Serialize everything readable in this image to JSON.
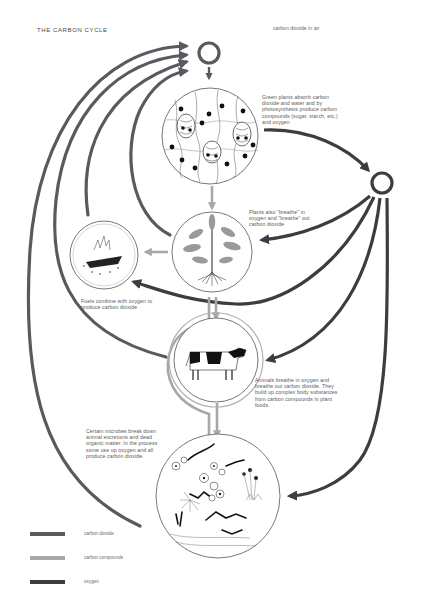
{
  "title": "THE CARBON CYCLE",
  "air_label": "carbon dioxide in air",
  "colors": {
    "carbon_dioxide": "#5c5860",
    "carbon_compounds": "#a8a8a8",
    "oxygen": "#3e3c40",
    "outline": "#555555",
    "text": "#5a5a5a"
  },
  "nodes": {
    "co2_circle": {
      "label": "carbon dioxide in air",
      "cx": 209,
      "cy": 53
    },
    "o2_circle": {
      "label": "oxygen",
      "cx": 382,
      "cy": 183
    },
    "leaf_cells": {
      "label": "leaf cells (photosynthesis)",
      "cx": 210,
      "cy": 136
    },
    "plant": {
      "label": "plant",
      "cx": 212,
      "cy": 252
    },
    "fire": {
      "label": "burning fuel",
      "cx": 104,
      "cy": 255
    },
    "cow": {
      "label": "cow",
      "cx": 216,
      "cy": 360
    },
    "microbes": {
      "label": "microbes",
      "cx": 218,
      "cy": 496
    }
  },
  "captions": {
    "photosynthesis": "Green plants absorb carbon dioxide and water and by photosynthesis produce carbon compounds (sugar, starch, etc.) and oxygen",
    "plant_respiration": "Plants also \"breathe\" in oxygen and \"breathe\" out carbon dioxide",
    "combustion": "Fuels combine with oxygen to produce carbon dioxide",
    "animals": "Animals breathe in oxygen and breathe out carbon dioxide. They build up complex body substances from carbon compounds in plant foods.",
    "decomposition": "Certain microbes break down animal excretions and dead organic matter. In the process some use up oxygen and all produce carbon dioxide."
  },
  "legend": {
    "items": [
      {
        "label": "carbon dioxide",
        "color": "#5c5860"
      },
      {
        "label": "carbon compounds",
        "color": "#a8a8a8"
      },
      {
        "label": "oxygen",
        "color": "#3e3c40"
      }
    ]
  }
}
